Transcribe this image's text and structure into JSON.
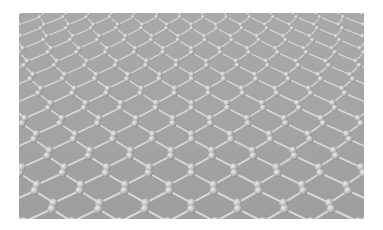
{
  "image": {
    "subject": "graphene-hexagonal-lattice",
    "background_color": "#ffffff",
    "panel_color": "#a5a5a5",
    "bond_color": "#d8d8d8",
    "atom_color": "#bdbdbd",
    "atom_highlight": "#ececec"
  }
}
